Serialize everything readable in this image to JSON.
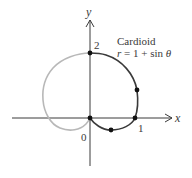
{
  "figure": {
    "title": "Cardioid",
    "equation": "r = 1 + sin θ",
    "equation_parts": {
      "r": "r",
      "rest": " = 1 + sin ",
      "theta": "θ"
    },
    "axes": {
      "x_label": "x",
      "y_label": "y",
      "origin_label": "0",
      "x_tick_label": "1",
      "y_tick_label": "2"
    },
    "colors": {
      "axis": "#3a3a3a",
      "curve_dark": "#3a3a3a",
      "curve_light": "#b8b8b8",
      "points": "#111111"
    },
    "highlighted_points": [
      {
        "label": "(0, 2)",
        "theta": "π/2"
      },
      {
        "label": "rightmost",
        "theta": "π/6"
      },
      {
        "label": "(1, 0)",
        "theta": "0"
      },
      {
        "label": "lowest",
        "theta": "-π/6"
      },
      {
        "label": "origin",
        "theta": "-π/2"
      }
    ]
  }
}
